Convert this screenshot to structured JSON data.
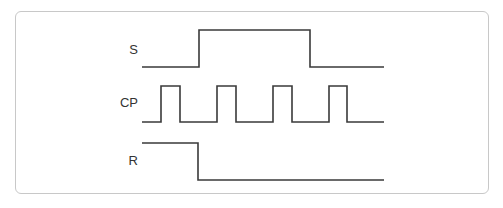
{
  "diagram": {
    "title": "",
    "colors": {
      "waveform": "#3a3a3a",
      "frame_border": "#c8c8c8",
      "label": "#333333",
      "background": "#ffffff"
    },
    "signals": [
      {
        "name": "S",
        "label_pos": {
          "x": 98,
          "y": 42
        },
        "points": [
          [
            142,
            67
          ],
          [
            199,
            67
          ],
          [
            199,
            30
          ],
          [
            310,
            30
          ],
          [
            310,
            67
          ],
          [
            384,
            67
          ]
        ]
      },
      {
        "name": "CP",
        "label_pos": {
          "x": 98,
          "y": 95
        },
        "points": [
          [
            142,
            122
          ],
          [
            161,
            122
          ],
          [
            161,
            86
          ],
          [
            180,
            86
          ],
          [
            180,
            122
          ],
          [
            217,
            122
          ],
          [
            217,
            86
          ],
          [
            236,
            86
          ],
          [
            236,
            122
          ],
          [
            273,
            122
          ],
          [
            273,
            86
          ],
          [
            292,
            86
          ],
          [
            292,
            122
          ],
          [
            329,
            122
          ],
          [
            329,
            86
          ],
          [
            347,
            86
          ],
          [
            347,
            122
          ],
          [
            384,
            122
          ]
        ]
      },
      {
        "name": "R",
        "label_pos": {
          "x": 98,
          "y": 153
        },
        "points": [
          [
            142,
            143
          ],
          [
            198,
            143
          ],
          [
            198,
            180
          ],
          [
            384,
            180
          ]
        ]
      }
    ]
  }
}
